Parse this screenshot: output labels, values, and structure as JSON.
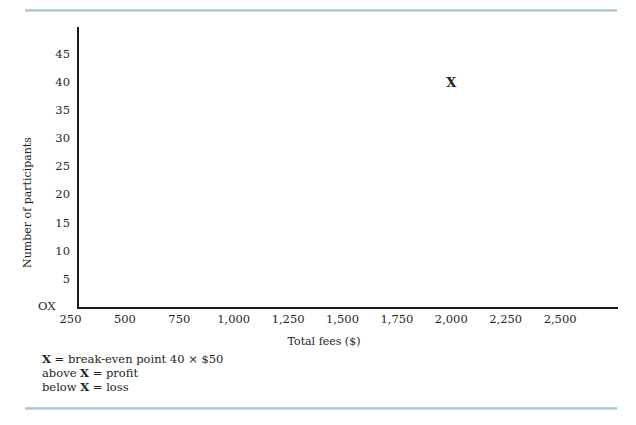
{
  "chart_data": {
    "type": "scatter",
    "title": "",
    "xlabel": "Total fees ($)",
    "ylabel": "Number of participants",
    "origin_label": "OX",
    "grid": false,
    "legend_position": "below-axis-left",
    "xlim": [
      0,
      2750
    ],
    "ylim": [
      0,
      47.5
    ],
    "x_ticks": [
      "250",
      "500",
      "750",
      "1,000",
      "1,250",
      "1,500",
      "1,750",
      "2,000",
      "2,250",
      "2,500"
    ],
    "x_tick_values": [
      250,
      500,
      750,
      1000,
      1250,
      1500,
      1750,
      2000,
      2250,
      2500
    ],
    "y_ticks": [
      "5",
      "10",
      "15",
      "20",
      "25",
      "30",
      "35",
      "40",
      "45"
    ],
    "y_tick_values": [
      5,
      10,
      15,
      20,
      25,
      30,
      35,
      40,
      45
    ],
    "points": [
      {
        "label": "X",
        "x": 2000,
        "y": 40
      }
    ],
    "annotations": [
      {
        "prefix": "",
        "symbol": "X",
        "suffix": " = break-even point 40 × $50"
      },
      {
        "prefix": "above ",
        "symbol": "X",
        "suffix": " = profit"
      },
      {
        "prefix": "below ",
        "symbol": "X",
        "suffix": " = loss"
      }
    ]
  },
  "colors": {
    "axis": "#1a1a1a",
    "text": "#231f20",
    "rule": "#a9c6d2",
    "background": "#ffffff"
  }
}
